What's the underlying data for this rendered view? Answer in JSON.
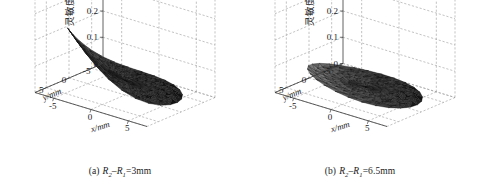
{
  "figure": {
    "panels": [
      {
        "id": "a",
        "caption_label": "(a)",
        "caption_var1": "R",
        "caption_sub1": "2",
        "caption_dash": "–",
        "caption_var2": "R",
        "caption_sub2": "1",
        "caption_value": "=3mm",
        "caption_full": "(a) R2–R1=3mm"
      },
      {
        "id": "b",
        "caption_label": "(b)",
        "caption_var1": "R",
        "caption_sub1": "2",
        "caption_dash": "–",
        "caption_var2": "R",
        "caption_sub2": "1",
        "caption_value": "=6.5mm",
        "caption_full": "(b) R2–R1=6.5mm"
      }
    ]
  },
  "chart_data": [
    {
      "type": "surface",
      "panel": "a",
      "title": "(a) R2–R1=3mm",
      "xlabel": "x/mm",
      "ylabel": "y/mm",
      "zlabel": "灵敏度",
      "xlim": [
        -7.5,
        7.5
      ],
      "ylim": [
        -7.5,
        7.5
      ],
      "zlim": [
        0,
        0.4
      ],
      "xticks": [
        -5,
        0,
        5
      ],
      "xticklabels": [
        "-5",
        "0",
        "5"
      ],
      "yticks": [
        5,
        0,
        -5
      ],
      "yticklabels": [
        "5",
        "0",
        "-5"
      ],
      "zticks": [
        0,
        0.1,
        0.2,
        0.3,
        0.4
      ],
      "zticklabels": [
        "0",
        "0.1",
        "0.2",
        "0.3",
        "0.4"
      ],
      "grid": true,
      "legend": "none",
      "colormap": "gray",
      "description": "Triangulated sensitivity surface over a circular x-y domain; sharp peak near the back-left corner reaching about 0.40, falling steeply toward a broad flat lobe near 0.02 across the front-right region.",
      "peak_value": 0.4,
      "peak_x": -5.0,
      "peak_y": 5.0,
      "baseline_value": 0.02,
      "radial_profile": {
        "r": [
          0,
          1,
          2,
          3,
          4,
          5,
          6,
          7
        ],
        "z_back_left": [
          0.1,
          0.15,
          0.22,
          0.29,
          0.34,
          0.38,
          0.4,
          0.4
        ],
        "z_front_right": [
          0.1,
          0.08,
          0.06,
          0.05,
          0.04,
          0.03,
          0.02,
          0.02
        ]
      }
    },
    {
      "type": "surface",
      "panel": "b",
      "title": "(b) R2–R1=6.5mm",
      "xlabel": "x/mm",
      "ylabel": "y/mm",
      "zlabel": "灵敏度",
      "xlim": [
        -7.5,
        7.5
      ],
      "ylim": [
        -7.5,
        7.5
      ],
      "zlim": [
        0,
        0.4
      ],
      "xticks": [
        -5,
        0,
        5
      ],
      "xticklabels": [
        "-5",
        "0",
        "5"
      ],
      "yticks": [
        5,
        0,
        -5
      ],
      "yticklabels": [
        "5",
        "0",
        "-5"
      ],
      "zticks": [
        0,
        0.1,
        0.2,
        0.3,
        0.4
      ],
      "zticklabels": [
        "0",
        "0.1",
        "0.2",
        "0.3",
        "0.4"
      ],
      "grid": true,
      "legend": "none",
      "colormap": "gray",
      "description": "Triangulated sensitivity surface over a circular x-y domain; low flat elliptical disk peaking near 0.11 at the back-left edge and decaying to about 0.01 toward the front-right.",
      "peak_value": 0.11,
      "peak_x": -5.0,
      "peak_y": 5.0,
      "baseline_value": 0.01,
      "radial_profile": {
        "r": [
          0,
          1,
          2,
          3,
          4,
          5,
          6,
          7
        ],
        "z_back_left": [
          0.05,
          0.06,
          0.07,
          0.08,
          0.09,
          0.1,
          0.11,
          0.11
        ],
        "z_front_right": [
          0.05,
          0.04,
          0.035,
          0.03,
          0.02,
          0.015,
          0.01,
          0.01
        ]
      }
    }
  ],
  "colors": {
    "grid": "#9a9a9a",
    "axis": "#3a3a3a",
    "text": "#1a1a1a",
    "surface_dark": "#1c1c1c",
    "surface_light": "#c9c9c9",
    "background": "#ffffff"
  }
}
